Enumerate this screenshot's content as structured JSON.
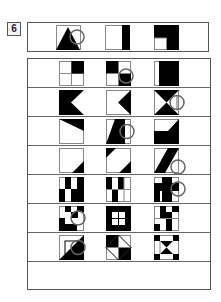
{
  "question": {
    "number": "6"
  },
  "header": {
    "figures": [
      "triangle-with-circle",
      "right-black-bar",
      "l-shaped-black-corner"
    ]
  },
  "options": {
    "rows": [
      [
        "grid-top-right-black",
        "diagonal-checker-with-circle",
        "thin-left-strip-black-rest"
      ],
      [
        "black-with-left-arrow-cut",
        "left-pointing-black-triangle",
        "bowtie-with-circle"
      ],
      [
        "top-right-triangle-black",
        "parallelogram-with-circle",
        "bottom-notched-black"
      ],
      [
        "bottom-right-triangle-black",
        "opposite-corner-triangles",
        "diagonal-band-with-circle"
      ],
      [
        "vertical-bars-pattern-a",
        "vertical-bars-pattern-b",
        "cross-pattern-with-circle"
      ],
      [
        "checker-pattern-with-circle",
        "black-frame-with-window",
        "staircase-bars"
      ],
      [
        "diagonal-split-square-with-circle",
        "diamond-triangles",
        "hourglass-with-corners"
      ]
    ]
  },
  "colors": {
    "ink": "#000000",
    "border": "#555555",
    "circle": "#666666"
  }
}
